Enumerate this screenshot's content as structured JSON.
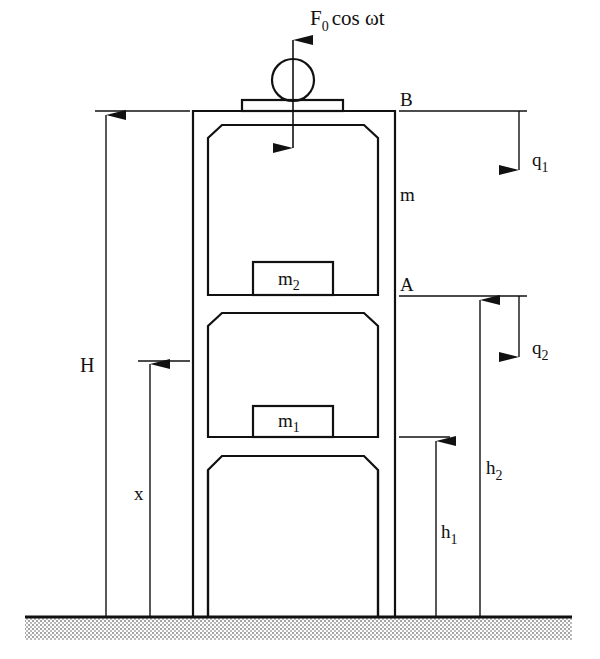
{
  "figure": {
    "type": "structural dynamics schematic"
  },
  "labels": {
    "force": {
      "main": "F",
      "sub": "0",
      "rest": "cos ωt"
    },
    "point_B": "B",
    "point_A": "A",
    "mass_frame": "m",
    "mass_1": {
      "main": "m",
      "sub": "1"
    },
    "mass_2": {
      "main": "m",
      "sub": "2"
    },
    "q1": {
      "main": "q",
      "sub": "1"
    },
    "q2": {
      "main": "q",
      "sub": "2"
    },
    "height_total": "H",
    "position_x": "x",
    "h1": {
      "main": "h",
      "sub": "1"
    },
    "h2": {
      "main": "h",
      "sub": "2"
    }
  },
  "colors": {
    "line": "#111111",
    "ground_hatch": "#888888",
    "background": "#ffffff"
  }
}
